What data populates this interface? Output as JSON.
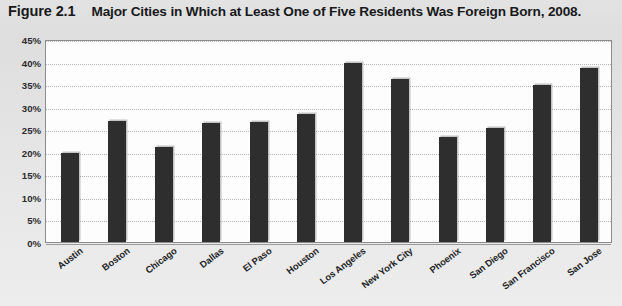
{
  "figure": {
    "number": "Figure 2.1",
    "title": "Major Cities in Which at Least One of Five Residents Was Foreign Born, 2008."
  },
  "colors": {
    "bar": "#2e2e2e",
    "page_background": "#dcdcdc",
    "plot_background": "#fdfdfd",
    "gridline": "#b4b4b4",
    "text": "#18191b"
  },
  "chart_data": {
    "type": "bar",
    "title": "Major Cities in Which at Least One of Five Residents Was Foreign Born, 2008.",
    "xlabel": "",
    "ylabel": "",
    "ylim": [
      0,
      45
    ],
    "ytick_step": 5,
    "ytick_labels": [
      "0%",
      "5%",
      "10%",
      "15%",
      "20%",
      "25%",
      "30%",
      "35%",
      "40%",
      "45%"
    ],
    "ytick_values": [
      0,
      5,
      10,
      15,
      20,
      25,
      30,
      35,
      40,
      45
    ],
    "grid": true,
    "legend": false,
    "value_unit": "percent",
    "categories": [
      "Austin",
      "Boston",
      "Chicago",
      "Dallas",
      "El Paso",
      "Houston",
      "Los Angeles",
      "New York City",
      "Phoenix",
      "San Diego",
      "San Francisco",
      "San Jose"
    ],
    "values": [
      19.8,
      26.8,
      21.0,
      26.3,
      26.5,
      28.4,
      39.6,
      36.2,
      23.3,
      25.2,
      34.8,
      38.5
    ]
  }
}
